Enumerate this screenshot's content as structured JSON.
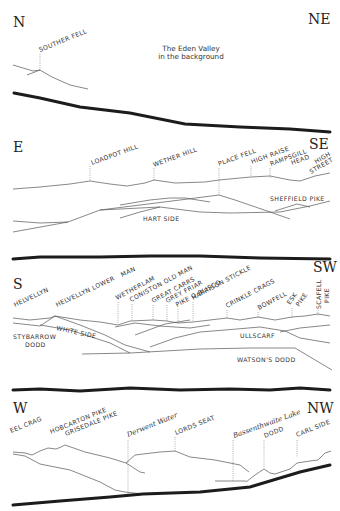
{
  "panels": [
    {
      "id": "north",
      "direction_left": "N",
      "direction_right": "NE",
      "note_lines": [
        "The Eden Valley",
        "in the background"
      ],
      "peaks": [
        "SOUTHER FELL"
      ]
    },
    {
      "id": "east",
      "direction_left": "E",
      "direction_right": "SE",
      "peaks": [
        "LOADPOT HILL",
        "WETHER HILL",
        "PLACE FELL",
        "HIGH RAISE",
        "RAMPSGILL",
        "HEAD",
        "HIGH",
        "STREET"
      ],
      "lower_labels": [
        "HART SIDE",
        "SHEFFIELD PIKE"
      ]
    },
    {
      "id": "south",
      "direction_left": "S",
      "direction_right": "SW",
      "peaks": [
        "HELVELLYN",
        "HELVELLYN LOWER",
        "MAN",
        "WETHERLAM",
        "CONISTON OLD MAN",
        "GREAT CARRS",
        "GREY FRIAR",
        "PIKE O BLISCO",
        "HARRISON STICKLE",
        "CRINKLE CRAGS",
        "BOWFELL",
        "ESK",
        "PIKE",
        "SCAFELL",
        "PIKE"
      ],
      "lower_labels": [
        "WHITE SIDE",
        "STYBARROW",
        "DODD",
        "ULLSCARF",
        "WATSON'S DODD"
      ]
    },
    {
      "id": "west",
      "direction_left": "W",
      "direction_right": "NW",
      "peaks": [
        "EEL CRAG",
        "HOBCARTON PIKE",
        "GRISEDALE PIKE",
        "Derwent Water",
        "LORDS SEAT",
        "Bassenthwaite Lake",
        "DODD",
        "CARL SIDE"
      ]
    }
  ]
}
